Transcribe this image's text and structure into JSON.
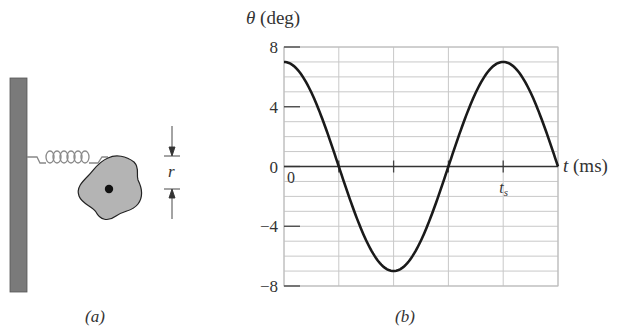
{
  "panel_a": {
    "caption": "(a)",
    "dimension_label": "r",
    "components": [
      "wall",
      "spring",
      "disk",
      "pivot",
      "dimension-arrows"
    ]
  },
  "panel_b": {
    "caption": "(b)"
  },
  "chart_data": {
    "type": "line",
    "title": "",
    "ylabel": "θ (deg)",
    "xlabel": "t (ms)",
    "ylim": [
      -8,
      8
    ],
    "xlim": [
      0,
      5
    ],
    "y_ticks": [
      8,
      4,
      0,
      -4,
      -8
    ],
    "y_tick_labels": [
      "8",
      "4",
      "0",
      "−4",
      "−8"
    ],
    "x_tick_labels": [
      {
        "x": 0,
        "label": "0"
      },
      {
        "x": 4,
        "label": "t_s"
      }
    ],
    "grid": true,
    "y_grid_step": 1,
    "x_grid_step": 1,
    "series": [
      {
        "name": "θ(t)",
        "amplitude": 7,
        "period": 4,
        "form": "θ = 7 cos(2π t / 4)",
        "points": [
          {
            "x": 0,
            "y": 7
          },
          {
            "x": 0.5,
            "y": 4.95
          },
          {
            "x": 1,
            "y": 0
          },
          {
            "x": 1.5,
            "y": -4.95
          },
          {
            "x": 2,
            "y": -7
          },
          {
            "x": 2.5,
            "y": -4.95
          },
          {
            "x": 3,
            "y": 0
          },
          {
            "x": 3.5,
            "y": 4.95
          },
          {
            "x": 4,
            "y": 7
          },
          {
            "x": 4.5,
            "y": 4.95
          },
          {
            "x": 5,
            "y": 0
          }
        ]
      }
    ],
    "colors": {
      "curve": "#1a1a1a",
      "grid": "#c8c8c8",
      "axis": "#444444"
    }
  }
}
